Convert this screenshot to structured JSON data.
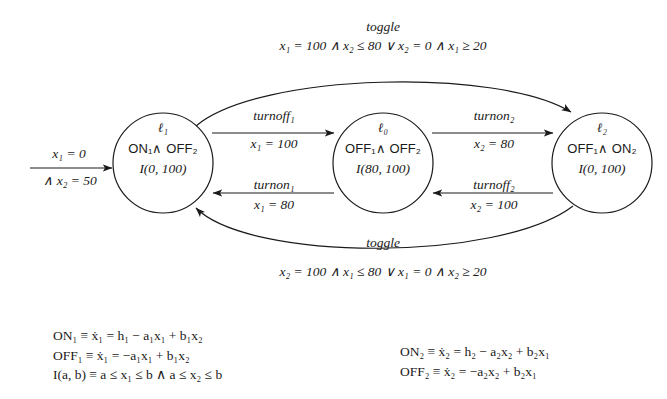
{
  "diagram": {
    "background_color": "#ffffff",
    "ink_color": "#1a1a1a"
  },
  "initial": {
    "name": "initial-arrow",
    "label_top": "x₁ = 0",
    "label_bottom": "∧ x₂ = 50"
  },
  "nodes": [
    {
      "id": "l1",
      "location": "ℓ₁",
      "mode": "ON₁∧ OFF₂",
      "invariant": "I(0, 100)",
      "cx": 163,
      "cy": 163,
      "r": 50
    },
    {
      "id": "l0",
      "location": "ℓ₀",
      "mode": "OFF₁∧ OFF₂",
      "invariant": "I(80, 100)",
      "cx": 383,
      "cy": 163,
      "r": 50
    },
    {
      "id": "l2",
      "location": "ℓ₂",
      "mode": "OFF₁∧ ON₂",
      "invariant": "I(0, 100)",
      "cx": 602,
      "cy": 163,
      "r": 50
    }
  ],
  "edges": [
    {
      "id": "l1-to-l0",
      "event": "turnoff₁",
      "guard": "x₁ = 100",
      "from": "l1",
      "to": "l0"
    },
    {
      "id": "l0-to-l1",
      "event": "turnon₁",
      "guard": "x₁ = 80",
      "from": "l0",
      "to": "l1"
    },
    {
      "id": "l0-to-l2",
      "event": "turnon₂",
      "guard": "x₂ = 80",
      "from": "l0",
      "to": "l2"
    },
    {
      "id": "l2-to-l0",
      "event": "turnoff₂",
      "guard": "x₂ = 100",
      "from": "l2",
      "to": "l0"
    },
    {
      "id": "l1-to-l2-toggle",
      "event": "toggle",
      "guard": "x₁ = 100 ∧ x₂ ≤ 80  ∨  x₂ = 0 ∧ x₁ ≥ 20",
      "from": "l1",
      "to": "l2"
    },
    {
      "id": "l2-to-l1-toggle",
      "event": "toggle",
      "guard": "x₂ = 100 ∧ x₁ ≤ 80  ∨  x₁ = 0 ∧ x₂ ≥ 20",
      "from": "l2",
      "to": "l1"
    }
  ],
  "legend_left": {
    "name": "definitions-left",
    "lines": [
      "ON₁ ≡ ẋ₁ = h₁ − a₁x₁ + b₁x₂",
      "OFF₁ ≡ ẋ₁ = −a₁x₁ + b₁x₂",
      "I(a, b) ≡ a ≤ x₁ ≤ b ∧ a ≤ x₂ ≤ b"
    ]
  },
  "legend_right": {
    "name": "definitions-right",
    "lines": [
      "ON₂ ≡ ẋ₂ = h₂ − a₂x₂ + b₂x₁",
      "OFF₂ ≡ ẋ₂ = −a₂x₂ + b₂x₁"
    ]
  }
}
